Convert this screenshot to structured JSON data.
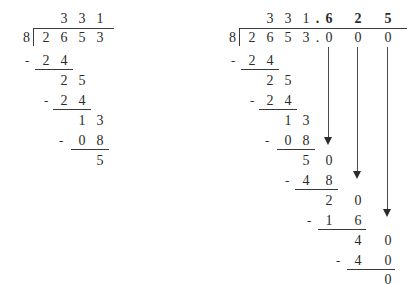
{
  "page": {
    "background_color": "#ffffff",
    "ink_color": "#2b2b2b"
  },
  "problems": [
    {
      "id": "whole-number-division",
      "label": "2653 divided by 8 with remainder",
      "divisor": "8",
      "dividend_digits": [
        "2",
        "6",
        "5",
        "3"
      ],
      "quotient_digits": [
        "3",
        "3",
        "1"
      ],
      "remainder": "5",
      "minus_sign": "-",
      "steps": [
        {
          "name": "step-1-subtrahend",
          "minus": "-",
          "digits": [
            "2",
            "4"
          ]
        },
        {
          "name": "step-1-difference",
          "minus": "",
          "digits": [
            "2",
            "5"
          ]
        },
        {
          "name": "step-2-subtrahend",
          "minus": "-",
          "digits": [
            "2",
            "4"
          ]
        },
        {
          "name": "step-2-difference",
          "minus": "",
          "digits": [
            "1",
            "3"
          ]
        },
        {
          "name": "step-3-subtrahend",
          "minus": "-",
          "digits": [
            "0",
            "8"
          ]
        },
        {
          "name": "step-3-difference",
          "minus": "",
          "digits": [
            "5"
          ]
        }
      ]
    },
    {
      "id": "decimal-division",
      "label": "2653 divided by 8 carried to decimals",
      "divisor": "8",
      "dividend_digits": [
        "2",
        "6",
        "5",
        "3"
      ],
      "dividend_point": ".",
      "dividend_decimal_zeros": [
        "0",
        "0",
        "0"
      ],
      "quotient_digits": [
        "3",
        "3",
        "1"
      ],
      "quotient_point": ".",
      "quotient_decimal_digits": [
        "6",
        "2",
        "5"
      ],
      "remainder": "0",
      "minus_sign": "-",
      "bring_down_arrows": [
        "bring-down-1",
        "bring-down-2",
        "bring-down-3"
      ],
      "steps": [
        {
          "name": "step-1-subtrahend",
          "minus": "-",
          "digits": [
            "2",
            "4"
          ]
        },
        {
          "name": "step-1-difference",
          "minus": "",
          "digits": [
            "2",
            "5"
          ]
        },
        {
          "name": "step-2-subtrahend",
          "minus": "-",
          "digits": [
            "2",
            "4"
          ]
        },
        {
          "name": "step-2-difference",
          "minus": "",
          "digits": [
            "1",
            "3"
          ]
        },
        {
          "name": "step-3-subtrahend",
          "minus": "-",
          "digits": [
            "0",
            "8"
          ]
        },
        {
          "name": "step-3-difference",
          "minus": "",
          "digits": [
            "5",
            "0"
          ]
        },
        {
          "name": "step-4-subtrahend",
          "minus": "-",
          "digits": [
            "4",
            "8"
          ]
        },
        {
          "name": "step-4-difference",
          "minus": "",
          "digits": [
            "2",
            "0"
          ]
        },
        {
          "name": "step-5-subtrahend",
          "minus": "-",
          "digits": [
            "1",
            "6"
          ]
        },
        {
          "name": "step-5-difference",
          "minus": "",
          "digits": [
            "4",
            "0"
          ]
        },
        {
          "name": "step-6-subtrahend",
          "minus": "-",
          "digits": [
            "4",
            "0"
          ]
        },
        {
          "name": "step-6-difference",
          "minus": "",
          "digits": [
            "0"
          ]
        }
      ]
    }
  ]
}
